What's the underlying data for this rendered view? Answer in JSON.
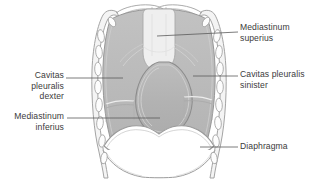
{
  "figure": {
    "background_color": "#ffffff",
    "palette": {
      "outline": "#9a9a9a",
      "outline_dark": "#7d7d7d",
      "pleural_fill": "#b9b9b9",
      "mediastinum_superius_fill": "#efefef",
      "heart_fill": "#b4b4b4",
      "rib_fill": "#fdfdfd",
      "label_text": "#3b3b3b",
      "leader_line": "#5a5a5a"
    }
  },
  "labels": {
    "mediastinum_superius": "Mediastinum\nsuperius",
    "cavitas_pleuralis_sinister": "Cavitas pleuralis\nsinister",
    "diaphragma": "Diaphragma",
    "cavitas_pleuralis_dexter": "Cavitas\npleuralis\ndexter",
    "mediastinum_inferius": "Mediastinum\ninferius"
  },
  "leader_lines": {
    "mediastinum_superius": {
      "x1": 157,
      "y1": 36,
      "x2": 238,
      "y2": 32
    },
    "cavitas_pleuralis_sinister": {
      "x1": 193,
      "y1": 76,
      "x2": 238,
      "y2": 76
    },
    "diaphragma": {
      "x1": 200,
      "y1": 147,
      "x2": 238,
      "y2": 147
    },
    "cavitas_pleuralis_dexter": {
      "x1": 123,
      "y1": 78,
      "x2": 66,
      "y2": 78
    },
    "mediastinum_inferius": {
      "x1": 160,
      "y1": 118,
      "x2": 67,
      "y2": 118
    }
  },
  "regions": [
    {
      "name": "mediastinum-superius",
      "description": "light central superior column"
    },
    {
      "name": "pleural-cavity-right",
      "description": "gray lung field, viewer left"
    },
    {
      "name": "pleural-cavity-left",
      "description": "gray lung field, viewer right"
    },
    {
      "name": "heart-pericardium",
      "description": "central teardrop organ"
    },
    {
      "name": "diaphragm",
      "description": "double-dome arch below thorax"
    },
    {
      "name": "thoracic-wall",
      "description": "ribs and chest wall outline"
    }
  ]
}
